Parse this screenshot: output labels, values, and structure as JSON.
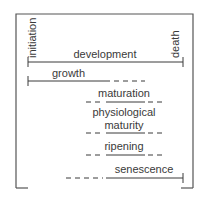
{
  "diagram": {
    "type": "timeline",
    "endpoints": {
      "start": "initiation",
      "end": "death"
    },
    "stages": [
      {
        "label": "development",
        "line": "solid full span with end ticks"
      },
      {
        "label": "growth",
        "line": "solid from start, dashed continuation"
      },
      {
        "label": "maturation",
        "line": "dashed-solid-dashed middle"
      },
      {
        "label_line1": "physiological",
        "label_line2": "maturity",
        "line": "dashed-solid-dashed middle"
      },
      {
        "label": "ripening",
        "line": "dashed-solid-dashed middle"
      },
      {
        "label": "senescence",
        "line": "dashed lead-in, solid to end tick"
      }
    ]
  }
}
